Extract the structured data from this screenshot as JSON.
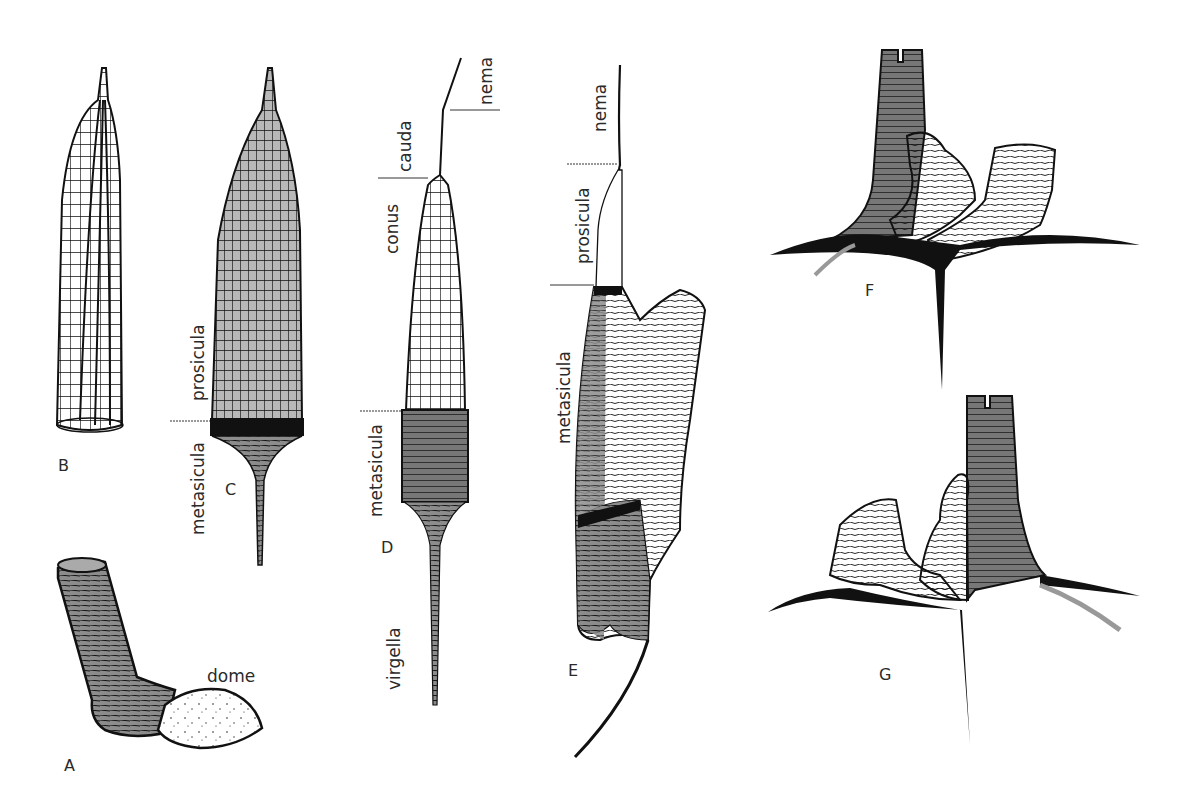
{
  "figure": {
    "panels": [
      {
        "id": "A",
        "letter": "A",
        "labels": [
          "dome"
        ]
      },
      {
        "id": "B",
        "letter": "B",
        "labels": []
      },
      {
        "id": "C",
        "letter": "C",
        "labels": [
          "prosicula",
          "metasicula"
        ]
      },
      {
        "id": "D",
        "letter": "D",
        "labels": [
          "nema",
          "cauda",
          "conus",
          "metasicula",
          "virgella"
        ]
      },
      {
        "id": "E",
        "letter": "E",
        "labels": [
          "nema",
          "prosicula",
          "metasicula"
        ]
      },
      {
        "id": "F",
        "letter": "F",
        "labels": []
      },
      {
        "id": "G",
        "letter": "G",
        "labels": []
      }
    ],
    "colors": {
      "ink": "#111111",
      "shade": "#8c8c8c",
      "background": "#ffffff"
    }
  },
  "labels": {
    "A": {
      "letter": "A",
      "dome": "dome"
    },
    "B": {
      "letter": "B"
    },
    "C": {
      "letter": "C",
      "prosicula": "prosicula",
      "metasicula": "metasicula"
    },
    "D": {
      "letter": "D",
      "nema": "nema",
      "cauda": "cauda",
      "conus": "conus",
      "metasicula": "metasicula",
      "virgella": "virgella"
    },
    "E": {
      "letter": "E",
      "nema": "nema",
      "prosicula": "prosicula",
      "metasicula": "metasicula"
    },
    "F": {
      "letter": "F"
    },
    "G": {
      "letter": "G"
    }
  }
}
